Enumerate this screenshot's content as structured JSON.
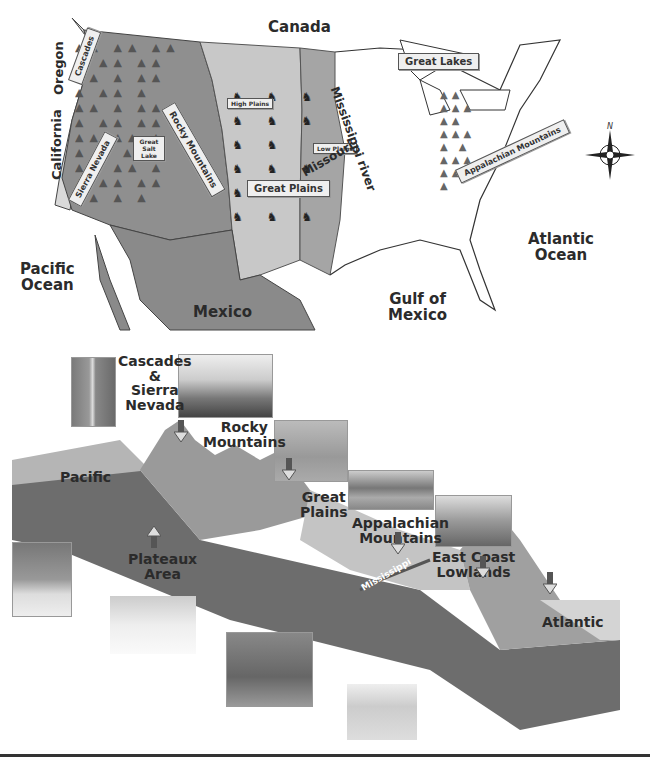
{
  "map": {
    "title_regions": {
      "canada": "Canada",
      "pacific_ocean": [
        "Pacific",
        "Ocean"
      ],
      "atlantic_ocean": [
        "Atlantic",
        "Ocean"
      ],
      "gulf": [
        "Gulf of",
        "Mexico"
      ],
      "mexico": "Mexico"
    },
    "states": {
      "oregon": "Oregon",
      "california": "California"
    },
    "signs": {
      "cascades": "Cascades",
      "sierra_nevada": "Sierra Nevada",
      "rocky_mountains": "Rocky Mountains",
      "great_salt_lake": "Great Salt Lake",
      "high_plains": "High Plains",
      "low_plains": "Low Plains",
      "great_plains": "Great Plains",
      "great_lakes": "Great Lakes",
      "appalachian_mountains": "Appalachian Mountains"
    },
    "rivers": {
      "mississippi": "Mississippi river",
      "missouri": "Missouri"
    },
    "compass": {
      "north_label": "N"
    },
    "colors": {
      "mountain_region": "#8f8f8f",
      "plains_light": "#c8c8c8",
      "low_plains": "#a5a5a5",
      "mexico": "#8a8a8a",
      "east": "#ffffff",
      "coast_strip": "#d9d9d9"
    }
  },
  "cross_section": {
    "labels": {
      "cascades_sierra": [
        "Cascades",
        "&",
        "Sierra",
        "Nevada"
      ],
      "rocky": [
        "Rocky",
        "Mountains"
      ],
      "great_plains": [
        "Great",
        "Plains"
      ],
      "appalachian": [
        "Appalachian",
        "Mountains"
      ],
      "east_coast": [
        "East Coast",
        "Lowlands"
      ],
      "plateaux": [
        "Plateaux",
        "Area"
      ],
      "pacific": "Pacific",
      "atlantic": "Atlantic",
      "mississippi": "Mississippi"
    },
    "photos": [
      {
        "name": "cascades-waterfall-photo"
      },
      {
        "name": "rocky-peak-photo"
      },
      {
        "name": "great-plains-tree-photo"
      },
      {
        "name": "appalachian-lake-photo"
      },
      {
        "name": "east-coast-farm-photo"
      },
      {
        "name": "pacific-beach-photo"
      },
      {
        "name": "plateau-desert-photo"
      },
      {
        "name": "rain-plains-photo"
      },
      {
        "name": "atlantic-sailboats-photo"
      }
    ]
  }
}
